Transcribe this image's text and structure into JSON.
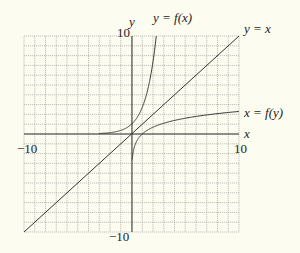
{
  "chart_data": {
    "type": "line",
    "title": "",
    "xlabel": "x",
    "ylabel": "y",
    "xlim": [
      -10,
      10
    ],
    "ylim": [
      -10,
      10
    ],
    "grid": true,
    "grid_step": 1,
    "tick_labels": {
      "x_min": "−10",
      "x_max": "10",
      "y_max": "10",
      "y_min": "−10"
    },
    "series": [
      {
        "name": "y = f(x)",
        "label": "y = f(x)",
        "function": "exp(x)",
        "x": [
          -3,
          -2,
          -1,
          0,
          0.5,
          1,
          1.5,
          2,
          2.3
        ],
        "y": [
          0.05,
          0.14,
          0.37,
          1,
          1.65,
          2.72,
          4.48,
          7.39,
          9.97
        ]
      },
      {
        "name": "y = x",
        "label": "y = x",
        "x": [
          -10,
          10
        ],
        "y": [
          -10,
          10
        ]
      },
      {
        "name": "x = f(y)",
        "label": "x = f(y)",
        "function": "ln(x)",
        "x": [
          0.05,
          0.14,
          0.37,
          1,
          2,
          4,
          7,
          10
        ],
        "y": [
          -3,
          -2,
          -1,
          0,
          0.69,
          1.39,
          1.95,
          2.3
        ]
      }
    ]
  },
  "labels": {
    "y_axis": "y",
    "x_axis": "x",
    "curve_fx": "y = f(x)",
    "curve_identity": "y = x",
    "curve_inverse": "x = f(y)",
    "tick_x_min": "−10",
    "tick_x_max": "10",
    "tick_y_max": "10",
    "tick_y_min": "−10"
  },
  "colors": {
    "background": "#fdfcf1",
    "grid": "#9a9a9a",
    "axis": "#333333",
    "curve": "#333333"
  }
}
